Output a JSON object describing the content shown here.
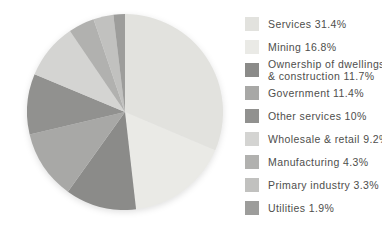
{
  "chart_data": {
    "type": "pie",
    "title": "",
    "legend_position": "right",
    "start_angle": "12-o-clock",
    "direction": "clockwise",
    "categories": [
      "Services",
      "Mining",
      "Ownership of dwellings & construction",
      "Government",
      "Other services",
      "Wholesale & retail",
      "Manufacturing",
      "Primary industry",
      "Utilities"
    ],
    "values": [
      31.4,
      16.8,
      11.7,
      11.4,
      10,
      9.2,
      4.3,
      3.3,
      1.9
    ],
    "labels": [
      "Services 31.4%",
      "Mining 16.8%",
      "Ownership of dwellings\n& construction 11.7%",
      "Government 11.4%",
      "Other services 10%",
      "Wholesale & retail 9.2%",
      "Manufacturing 4.3%",
      "Primary industry 3.3%",
      "Utilities 1.9%"
    ],
    "colors": [
      "#e2e2de",
      "#eaeae6",
      "#8b8b89",
      "#a8a8a6",
      "#91918f",
      "#d4d4d2",
      "#b1b1af",
      "#c1c1bf",
      "#9d9d9b"
    ],
    "text_color": "#4e4e4c",
    "background": "#ffffff"
  }
}
